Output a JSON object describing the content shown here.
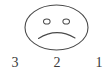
{
  "figure": {
    "kind": "sad-face-rating-scale",
    "background_color": "#ffffff",
    "stroke_color": "#4a4a4a",
    "label_color": "#3a3a3a"
  },
  "face": {
    "expression": "sad",
    "outline_shape": "ellipse",
    "eye_shape": "ellipse",
    "mouth_shape": "frown-arc",
    "eye_left_name": "left eye",
    "eye_right_name": "right eye",
    "mouth_name": "frowning mouth"
  },
  "scale": {
    "labels": [
      {
        "value": "3",
        "position": "left"
      },
      {
        "value": "2",
        "position": "center"
      },
      {
        "value": "1",
        "position": "right"
      }
    ]
  }
}
